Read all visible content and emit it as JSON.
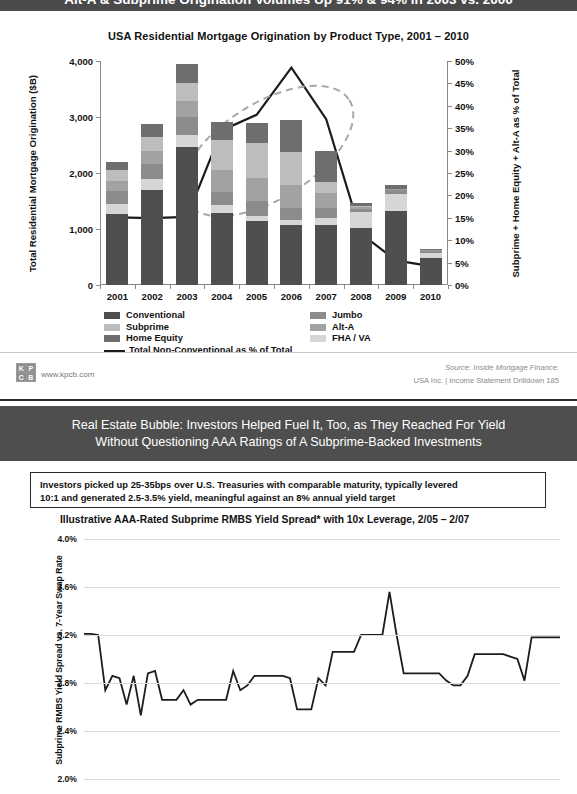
{
  "slide1": {
    "banner_title": "Alt-A & Subprime Origination Volumes Up 91% & 94% in 2003 vs. 2000",
    "chart_title": "USA Residential Mortgage Origination by Product Type, 2001 – 2010",
    "y_axis_left_title": "Total Residential Mortgage Origination ($B)",
    "y_axis_right_title": "Subprime + Home Equity + Alt-A as % of Total",
    "legend_left": [
      {
        "label": "Conventional",
        "color": "#4f4f4f"
      },
      {
        "label": "Subprime",
        "color": "#bdbdbd"
      },
      {
        "label": "Home Equity",
        "color": "#6e6e6e"
      }
    ],
    "legend_right": [
      {
        "label": "Jumbo",
        "color": "#8c8c8c"
      },
      {
        "label": "Alt-A",
        "color": "#a2a2a2"
      },
      {
        "label": "FHA / VA",
        "color": "#d6d6d6"
      }
    ],
    "legend_line_label": "Total Non-Conventional as % of Total",
    "footer": {
      "logo_cells": [
        "K",
        "P",
        "C",
        "B"
      ],
      "url": "www.kpcb.com",
      "source": "Source: Inside Mortgage Finance.",
      "deck": "USA Inc. | Income Statement Drilldown   185"
    },
    "chart_data": {
      "type": "bar",
      "title": "USA Residential Mortgage Origination by Product Type, 2001 – 2010",
      "xlabel": "",
      "ylabel": "Total Residential Mortgage Origination ($B)",
      "ylim": [
        0,
        4000
      ],
      "y_ticks": [
        "0",
        "1,000",
        "2,000",
        "3,000",
        "4,000"
      ],
      "y2label": "Subprime + Home Equity + Alt-A as % of Total",
      "y2lim": [
        0,
        50
      ],
      "y2_ticks": [
        "0%",
        "5%",
        "10%",
        "15%",
        "20%",
        "25%",
        "30%",
        "35%",
        "40%",
        "45%",
        "50%"
      ],
      "grid": false,
      "legend_position": "bottom",
      "categories": [
        "2001",
        "2002",
        "2003",
        "2004",
        "2005",
        "2006",
        "2007",
        "2008",
        "2009",
        "2010"
      ],
      "stacked": true,
      "series": [
        {
          "name": "Conventional",
          "color": "#4f4f4f",
          "values": [
            1265,
            1705,
            2460,
            1290,
            1135,
            1080,
            1070,
            1010,
            1320,
            490
          ]
        },
        {
          "name": "FHA / VA",
          "color": "#d6d6d6",
          "values": [
            175,
            180,
            220,
            135,
            90,
            80,
            120,
            290,
            300,
            90
          ]
        },
        {
          "name": "Jumbo",
          "color": "#8c8c8c",
          "values": [
            235,
            275,
            320,
            230,
            280,
            220,
            180,
            55,
            70,
            30
          ]
        },
        {
          "name": "Alt-A",
          "color": "#a2a2a2",
          "values": [
            190,
            240,
            290,
            395,
            400,
            400,
            275,
            35,
            20,
            10
          ]
        },
        {
          "name": "Subprime",
          "color": "#bdbdbd",
          "values": [
            190,
            235,
            320,
            540,
            625,
            600,
            190,
            25,
            10,
            5
          ]
        },
        {
          "name": "Home Equity",
          "color": "#6e6e6e",
          "values": [
            145,
            245,
            330,
            330,
            365,
            560,
            555,
            55,
            65,
            20
          ]
        }
      ],
      "line_series": {
        "name": "Total Non-Conventional as % of Total",
        "color": "#1c1c1c",
        "axis": "right",
        "values": [
          15.1,
          14.9,
          15.2,
          34.5,
          38.0,
          48.5,
          37.0,
          11.5,
          5.5,
          4.2
        ]
      },
      "annotations": [
        {
          "type": "dashed-ellipse",
          "note": "highlights 2003–2007 non-conventional share ramp"
        }
      ]
    }
  },
  "slide2": {
    "banner_line1": "Real Estate Bubble: Investors Helped Fuel It, Too, as They Reached For Yield",
    "banner_line2": "Without Questioning AAA Ratings of A Subprime-Backed Investments",
    "callout_line1": "Investors picked up 25-35bps over U.S. Treasuries with comparable maturity, typically levered",
    "callout_line2": "10:1 and generated 2.5-3.5% yield, meaningful against an 8% annual yield target",
    "chart_title": "Illustrative AAA-Rated Subprime RMBS Yield Spread* with 10x Leverage, 2/05 – 2/07",
    "y_axis_title": "Subprime RMBS Yield Spread vs. 7-Year Swap Rate",
    "chart_data": {
      "type": "line",
      "title": "Illustrative AAA-Rated Subprime RMBS Yield Spread* with 10x Leverage, 2/05 – 2/07",
      "xlabel": "",
      "ylabel": "Subprime RMBS Yield Spread vs. 7-Year Swap Rate",
      "ylim": [
        2.0,
        4.0
      ],
      "y_ticks": [
        "2.0%",
        "2.4%",
        "2.8%",
        "3.2%",
        "3.6%",
        "4.0%"
      ],
      "grid": true,
      "legend_position": "none",
      "series": [
        {
          "name": "Subprime RMBS Yield Spread vs. 7-Year Swap Rate",
          "color": "#1c1c1c",
          "values": [
            3.21,
            3.21,
            3.2,
            2.74,
            2.86,
            2.84,
            2.62,
            2.86,
            2.53,
            2.88,
            2.9,
            2.66,
            2.66,
            2.66,
            2.74,
            2.62,
            2.66,
            2.66,
            2.66,
            2.66,
            2.66,
            2.9,
            2.74,
            2.78,
            2.86,
            2.86,
            2.86,
            2.86,
            2.86,
            2.84,
            2.58,
            2.58,
            2.58,
            2.84,
            2.78,
            3.06,
            3.06,
            3.06,
            3.06,
            3.2,
            3.2,
            3.2,
            3.2,
            3.56,
            3.2,
            2.88,
            2.88,
            2.88,
            2.88,
            2.88,
            2.88,
            2.82,
            2.78,
            2.78,
            2.86,
            3.04,
            3.04,
            3.04,
            3.04,
            3.04,
            3.02,
            3.0,
            2.82,
            3.18,
            3.18,
            3.18,
            3.18,
            3.18
          ]
        }
      ]
    }
  }
}
